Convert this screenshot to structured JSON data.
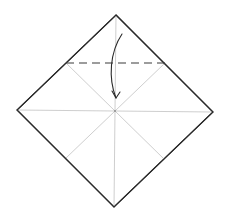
{
  "diagram": {
    "type": "origami-fold-step",
    "square": {
      "top": [
        116,
        15
      ],
      "right": [
        213,
        112
      ],
      "bottom": [
        114,
        207
      ],
      "left": [
        17,
        110
      ],
      "center": [
        115,
        111
      ]
    },
    "creases": [
      {
        "name": "vertical-crease",
        "from": [
          116,
          15
        ],
        "to": [
          114,
          207
        ]
      },
      {
        "name": "horizontal-crease",
        "from": [
          17,
          110
        ],
        "to": [
          213,
          112
        ]
      },
      {
        "name": "diag-crease-top-left",
        "from": [
          115,
          111
        ],
        "to": [
          66,
          63
        ]
      },
      {
        "name": "diag-crease-top-right",
        "from": [
          115,
          111
        ],
        "to": [
          165,
          63
        ]
      },
      {
        "name": "diag-crease-bottom-left",
        "from": [
          115,
          111
        ],
        "to": [
          66,
          158
        ]
      },
      {
        "name": "diag-crease-bottom-right",
        "from": [
          115,
          111
        ],
        "to": [
          164,
          159
        ]
      }
    ],
    "valley_fold_line": {
      "from": [
        66,
        63
      ],
      "to": [
        166,
        63
      ]
    },
    "fold_arrow": {
      "start": [
        122,
        34
      ],
      "end": [
        116,
        98
      ],
      "direction": "down"
    },
    "colors": {
      "outline": "#2a2a2a",
      "crease": "#c8c8c8",
      "fold_line": "#3a3a3a",
      "background": "#ffffff"
    }
  }
}
